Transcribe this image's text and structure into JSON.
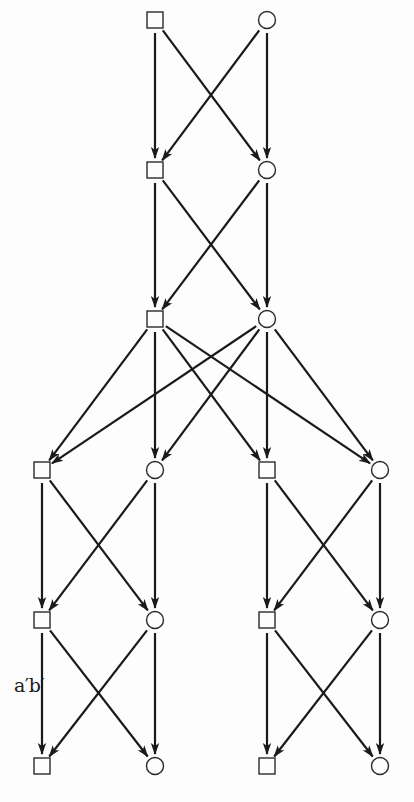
{
  "diagram": {
    "type": "directed-graph",
    "colors": {
      "line": "#1a1a1a",
      "background": "#fdfdfd"
    },
    "node_size": 16,
    "nodes": [
      {
        "id": "r1-sq",
        "shape": "square",
        "x": 155,
        "y": 20
      },
      {
        "id": "r1-ci",
        "shape": "circle",
        "x": 267,
        "y": 20
      },
      {
        "id": "r2-sq",
        "shape": "square",
        "x": 155,
        "y": 170
      },
      {
        "id": "r2-ci",
        "shape": "circle",
        "x": 267,
        "y": 170
      },
      {
        "id": "r3-sq",
        "shape": "square",
        "x": 155,
        "y": 319
      },
      {
        "id": "r3-ci",
        "shape": "circle",
        "x": 267,
        "y": 319
      },
      {
        "id": "r4-sq-a",
        "shape": "square",
        "x": 42,
        "y": 470
      },
      {
        "id": "r4-ci-a",
        "shape": "circle",
        "x": 155,
        "y": 470
      },
      {
        "id": "r4-sq-b",
        "shape": "square",
        "x": 267,
        "y": 470
      },
      {
        "id": "r4-ci-b",
        "shape": "circle",
        "x": 380,
        "y": 470
      },
      {
        "id": "r5-sq-a",
        "shape": "square",
        "x": 42,
        "y": 620
      },
      {
        "id": "r5-ci-a",
        "shape": "circle",
        "x": 155,
        "y": 620
      },
      {
        "id": "r5-sq-b",
        "shape": "square",
        "x": 267,
        "y": 620
      },
      {
        "id": "r5-ci-b",
        "shape": "circle",
        "x": 380,
        "y": 620
      },
      {
        "id": "r6-sq-a",
        "shape": "square",
        "x": 42,
        "y": 766
      },
      {
        "id": "r6-ci-a",
        "shape": "circle",
        "x": 155,
        "y": 766
      },
      {
        "id": "r6-sq-b",
        "shape": "square",
        "x": 267,
        "y": 766
      },
      {
        "id": "r6-ci-b",
        "shape": "circle",
        "x": 380,
        "y": 766
      }
    ],
    "edges": [
      {
        "from": "r1-sq",
        "to": "r2-sq"
      },
      {
        "from": "r1-sq",
        "to": "r2-ci"
      },
      {
        "from": "r1-ci",
        "to": "r2-sq"
      },
      {
        "from": "r1-ci",
        "to": "r2-ci"
      },
      {
        "from": "r2-sq",
        "to": "r3-sq"
      },
      {
        "from": "r2-sq",
        "to": "r3-ci"
      },
      {
        "from": "r2-ci",
        "to": "r3-sq"
      },
      {
        "from": "r2-ci",
        "to": "r3-ci"
      },
      {
        "from": "r3-sq",
        "to": "r4-sq-a"
      },
      {
        "from": "r3-sq",
        "to": "r4-ci-a"
      },
      {
        "from": "r3-sq",
        "to": "r4-sq-b"
      },
      {
        "from": "r3-sq",
        "to": "r4-ci-b"
      },
      {
        "from": "r3-ci",
        "to": "r4-sq-a"
      },
      {
        "from": "r3-ci",
        "to": "r4-ci-a"
      },
      {
        "from": "r3-ci",
        "to": "r4-sq-b"
      },
      {
        "from": "r3-ci",
        "to": "r4-ci-b"
      },
      {
        "from": "r4-sq-a",
        "to": "r5-sq-a"
      },
      {
        "from": "r4-sq-a",
        "to": "r5-ci-a"
      },
      {
        "from": "r4-ci-a",
        "to": "r5-sq-a"
      },
      {
        "from": "r4-ci-a",
        "to": "r5-ci-a"
      },
      {
        "from": "r4-sq-b",
        "to": "r5-sq-b"
      },
      {
        "from": "r4-sq-b",
        "to": "r5-ci-b"
      },
      {
        "from": "r4-ci-b",
        "to": "r5-sq-b"
      },
      {
        "from": "r4-ci-b",
        "to": "r5-ci-b"
      },
      {
        "from": "r5-sq-a",
        "to": "r6-sq-a",
        "label": "a′b′"
      },
      {
        "from": "r5-sq-a",
        "to": "r6-ci-a"
      },
      {
        "from": "r5-ci-a",
        "to": "r6-sq-a"
      },
      {
        "from": "r5-ci-a",
        "to": "r6-ci-a"
      },
      {
        "from": "r5-sq-b",
        "to": "r6-sq-b"
      },
      {
        "from": "r5-sq-b",
        "to": "r6-ci-b"
      },
      {
        "from": "r5-ci-b",
        "to": "r6-sq-b"
      },
      {
        "from": "r5-ci-b",
        "to": "r6-ci-b"
      }
    ],
    "labels": [
      {
        "text": "a′b′",
        "x": 14,
        "y": 674
      }
    ]
  }
}
